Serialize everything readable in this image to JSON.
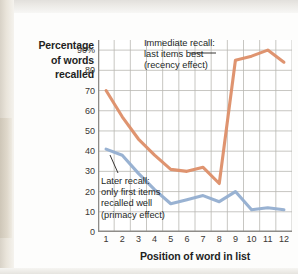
{
  "chart_data": {
    "type": "line",
    "title": "",
    "xlabel": "Position of word in list",
    "ylabel": "Percentage of words recalled",
    "ylabel_lines": [
      "Percentage",
      "of words",
      "recalled"
    ],
    "x": [
      1,
      2,
      3,
      4,
      5,
      6,
      7,
      8,
      9,
      10,
      11,
      12
    ],
    "categories": [
      "1",
      "2",
      "3",
      "4",
      "5",
      "6",
      "7",
      "8",
      "9",
      "10",
      "11",
      "12"
    ],
    "xlim": [
      1,
      12
    ],
    "ylim": [
      0,
      95
    ],
    "yticks": [
      0,
      10,
      20,
      30,
      40,
      50,
      60,
      70,
      80,
      90
    ],
    "ytick_labels": [
      "0",
      "10",
      "20",
      "30",
      "40",
      "50",
      "60",
      "70",
      "80",
      "90%"
    ],
    "grid": true,
    "legend": "annotations",
    "series": [
      {
        "name": "Immediate recall",
        "color": "#dd8e68",
        "values": [
          70,
          57,
          46,
          38,
          31,
          30,
          32,
          24,
          85,
          87,
          90,
          84
        ]
      },
      {
        "name": "Later recall",
        "color": "#94aed0",
        "values": [
          41,
          38,
          29,
          21,
          14,
          16,
          18,
          15,
          20,
          11,
          12,
          11
        ]
      }
    ],
    "annotations": [
      {
        "id": "recency",
        "lines": [
          "Immediate recall:",
          "last items best",
          "(recency effect)"
        ],
        "target_series": "Immediate recall"
      },
      {
        "id": "primacy",
        "lines": [
          "Later recall:",
          "only first items",
          "recalled well",
          "(primacy effect)"
        ],
        "target_series": "Later recall"
      }
    ]
  },
  "colors": {
    "immediate_recall": "#dd8e68",
    "later_recall": "#94aed0",
    "grid": "#b9b7b3",
    "axis": "#8e8c88",
    "text": "#231f1e"
  }
}
